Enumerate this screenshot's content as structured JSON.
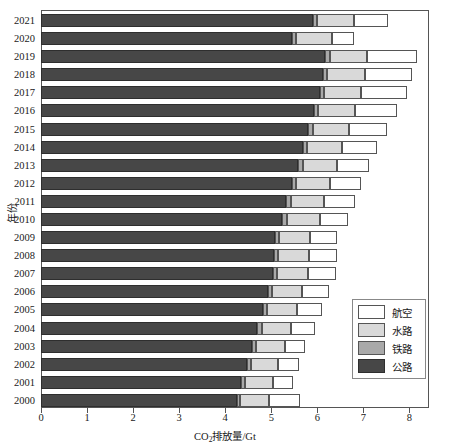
{
  "chart_data": {
    "type": "bar",
    "orientation": "horizontal",
    "stacked": true,
    "title": "",
    "xlabel": "CO2排放量/Gt",
    "xlabel_parts": {
      "prefix": "CO",
      "sub": "2",
      "suffix": "排放量/Gt"
    },
    "ylabel": "年份",
    "xlim": [
      0,
      8.45
    ],
    "xticks": [
      0,
      1,
      2,
      3,
      4,
      5,
      6,
      7,
      8
    ],
    "xticklabels": [
      "0",
      "1",
      "2",
      "3",
      "4",
      "5",
      "6",
      "7",
      "8"
    ],
    "grid": false,
    "legend_position": "center-right",
    "categories": [
      "2021",
      "2020",
      "2019",
      "2018",
      "2017",
      "2016",
      "2015",
      "2014",
      "2013",
      "2012",
      "2011",
      "2010",
      "2009",
      "2008",
      "2007",
      "2006",
      "2005",
      "2004",
      "2003",
      "2002",
      "2001",
      "2000"
    ],
    "series": [
      {
        "name": "公路",
        "color": "#474747",
        "values": [
          5.9,
          5.45,
          6.17,
          6.12,
          6.05,
          5.92,
          5.8,
          5.68,
          5.58,
          5.44,
          5.33,
          5.24,
          5.08,
          5.05,
          5.03,
          4.92,
          4.82,
          4.7,
          4.58,
          4.47,
          4.35,
          4.25
        ]
      },
      {
        "name": "铁路",
        "color": "#a9a9a9",
        "values": [
          0.1,
          0.09,
          0.1,
          0.1,
          0.1,
          0.1,
          0.1,
          0.1,
          0.1,
          0.1,
          0.1,
          0.1,
          0.09,
          0.09,
          0.09,
          0.09,
          0.09,
          0.09,
          0.09,
          0.08,
          0.08,
          0.08
        ]
      },
      {
        "name": "水路",
        "color": "#d9d9d9",
        "values": [
          0.8,
          0.77,
          0.82,
          0.82,
          0.8,
          0.79,
          0.78,
          0.76,
          0.75,
          0.73,
          0.72,
          0.71,
          0.68,
          0.68,
          0.67,
          0.66,
          0.65,
          0.63,
          0.62,
          0.6,
          0.6,
          0.62
        ]
      },
      {
        "name": "航空",
        "color": "#ffffff",
        "values": [
          0.73,
          0.49,
          1.07,
          1.01,
          0.99,
          0.92,
          0.84,
          0.76,
          0.7,
          0.68,
          0.66,
          0.62,
          0.57,
          0.6,
          0.61,
          0.58,
          0.55,
          0.52,
          0.44,
          0.46,
          0.44,
          0.68
        ]
      }
    ],
    "totals": [
      7.53,
      6.8,
      8.16,
      8.05,
      7.94,
      7.73,
      7.52,
      7.3,
      7.13,
      6.95,
      6.81,
      6.67,
      6.42,
      6.42,
      6.4,
      6.25,
      6.11,
      5.94,
      5.73,
      5.61,
      5.47,
      5.63
    ]
  },
  "legend": {
    "items": [
      {
        "label": "航空",
        "key": "air"
      },
      {
        "label": "水路",
        "key": "water"
      },
      {
        "label": "铁路",
        "key": "rail"
      },
      {
        "label": "公路",
        "key": "road"
      }
    ]
  },
  "colors": {
    "road": "#474747",
    "rail": "#a9a9a9",
    "water": "#d9d9d9",
    "air": "#ffffff",
    "axis": "#555555",
    "background": "#ffffff"
  }
}
